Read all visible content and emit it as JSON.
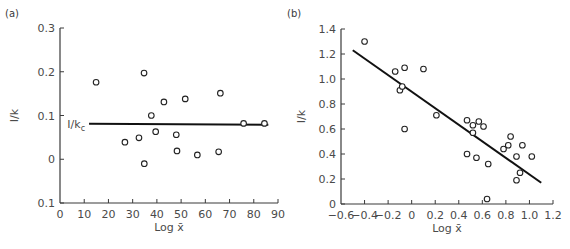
{
  "chart_data": [
    {
      "panel": "(a)",
      "type": "scatter",
      "xlabel": "Log x̄",
      "ylabel": "I/k",
      "xlim": [
        0,
        90
      ],
      "ylim": [
        -0.1,
        0.3
      ],
      "x_ticks": [
        0,
        10,
        20,
        30,
        40,
        50,
        60,
        70,
        80,
        90
      ],
      "x_tick_labels": [
        "0",
        "10",
        "20",
        "30",
        "40",
        "50",
        "60",
        "70",
        "80",
        "90"
      ],
      "y_ticks": [
        -0.1,
        0,
        0.1,
        0.2,
        0.3
      ],
      "y_tick_labels": [
        "0.1",
        "0",
        "0.1",
        "0.2",
        "0.3"
      ],
      "grid": false,
      "points": [
        [
          14.9,
          0.176
        ],
        [
          34.7,
          0.197
        ],
        [
          26.8,
          0.039
        ],
        [
          32.6,
          0.049
        ],
        [
          34.8,
          -0.01
        ],
        [
          37.7,
          0.1
        ],
        [
          39.5,
          0.063
        ],
        [
          42.9,
          0.131
        ],
        [
          48.0,
          0.056
        ],
        [
          48.3,
          0.019
        ],
        [
          51.7,
          0.138
        ],
        [
          56.7,
          0.01
        ],
        [
          65.5,
          0.017
        ],
        [
          66.2,
          0.151
        ],
        [
          75.8,
          0.082
        ],
        [
          84.4,
          0.082
        ]
      ],
      "reference_line": {
        "label": "I/k",
        "label_sub": "c",
        "x": [
          12,
          86
        ],
        "y": [
          0.081,
          0.079
        ]
      }
    },
    {
      "panel": "(b)",
      "type": "scatter",
      "xlabel": "Log x̄",
      "ylabel": "I/k",
      "xlim": [
        -0.6,
        1.2
      ],
      "ylim": [
        0,
        1.4
      ],
      "x_ticks": [
        -0.6,
        -0.4,
        -0.2,
        0,
        0.2,
        0.4,
        0.6,
        0.8,
        1.0,
        1.2
      ],
      "x_tick_labels": [
        "−0.6",
        "−0.4",
        "−0.2",
        "0",
        "0.2",
        "0.4",
        "0.6",
        "0.8",
        "1.0",
        "1.2"
      ],
      "y_ticks": [
        0,
        0.2,
        0.4,
        0.6,
        0.8,
        1.0,
        1.2,
        1.4
      ],
      "y_tick_labels": [
        "0",
        "0.2",
        "0.4",
        "0.6",
        "0.8",
        "1.0",
        "1.2",
        "1.4"
      ],
      "grid": false,
      "points": [
        [
          -0.4,
          1.3
        ],
        [
          -0.14,
          1.06
        ],
        [
          -0.06,
          1.09
        ],
        [
          0.1,
          1.08
        ],
        [
          -0.1,
          0.91
        ],
        [
          -0.08,
          0.94
        ],
        [
          -0.06,
          0.6
        ],
        [
          0.21,
          0.71
        ],
        [
          0.47,
          0.67
        ],
        [
          0.52,
          0.63
        ],
        [
          0.57,
          0.66
        ],
        [
          0.61,
          0.62
        ],
        [
          0.52,
          0.57
        ],
        [
          0.47,
          0.4
        ],
        [
          0.55,
          0.37
        ],
        [
          0.65,
          0.32
        ],
        [
          0.64,
          0.04
        ],
        [
          0.78,
          0.44
        ],
        [
          0.82,
          0.47
        ],
        [
          0.84,
          0.54
        ],
        [
          0.89,
          0.38
        ],
        [
          0.94,
          0.47
        ],
        [
          0.92,
          0.25
        ],
        [
          0.89,
          0.19
        ],
        [
          1.02,
          0.38
        ]
      ],
      "regression_line": {
        "x": [
          -0.5,
          1.1
        ],
        "y": [
          1.23,
          0.17
        ]
      }
    }
  ]
}
